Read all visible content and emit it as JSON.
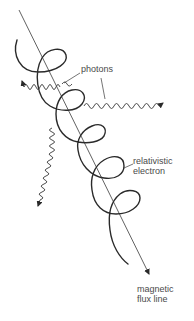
{
  "diagram": {
    "labels": {
      "photons": "photons",
      "electron_line1": "relativistic",
      "electron_line2": "electron",
      "flux_line1": "magnetic",
      "flux_line2": "flux line"
    },
    "colors": {
      "stroke": "#2a2a2a",
      "thin_stroke": "#3a3a3a",
      "text": "#4a4a4a",
      "background": "#ffffff"
    },
    "elements": [
      {
        "type": "magnetic-flux-line",
        "from": [
          19,
          10
        ],
        "to": [
          150,
          276
        ],
        "arrow": "end"
      },
      {
        "type": "electron-helix",
        "loops": 5,
        "start": [
          17,
          40
        ],
        "end": [
          128,
          264
        ]
      },
      {
        "type": "photon",
        "direction": "left",
        "arrow_tip": [
          20,
          80
        ]
      },
      {
        "type": "photon",
        "direction": "right",
        "arrow_tip": [
          166,
          103
        ]
      },
      {
        "type": "photon",
        "direction": "down",
        "arrow_tip": [
          38,
          208
        ]
      }
    ]
  }
}
